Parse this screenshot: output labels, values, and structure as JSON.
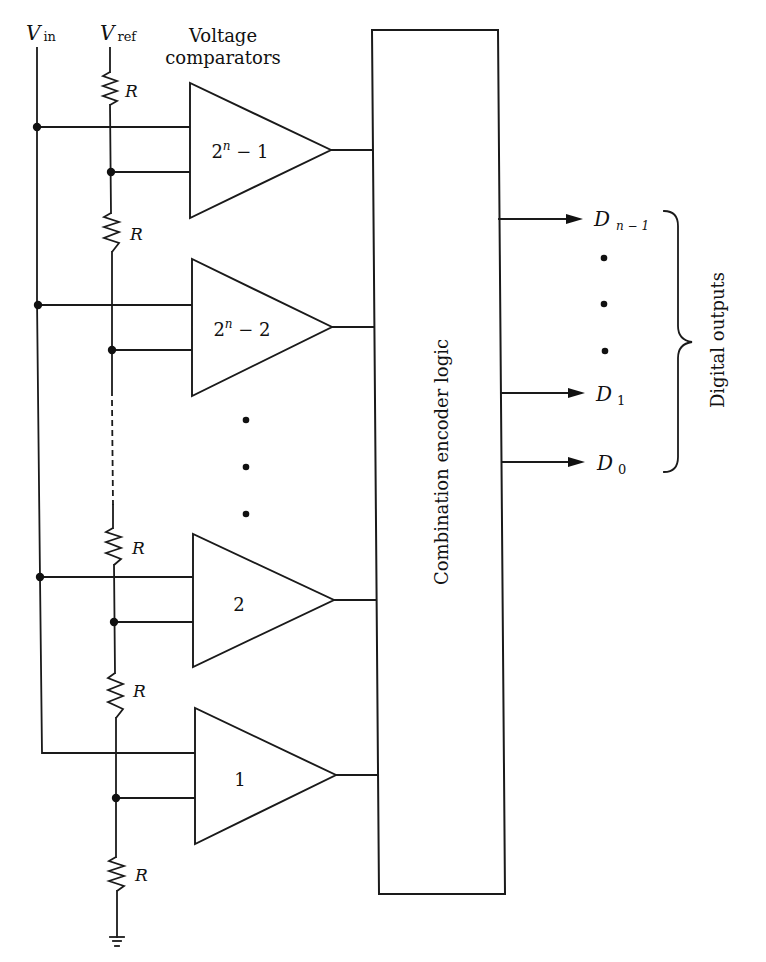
{
  "diagram": {
    "labels": {
      "vin_main": "V",
      "vin_sub": "in",
      "vref_main": "V",
      "vref_sub": "ref",
      "comparators_line1": "Voltage",
      "comparators_line2": "comparators",
      "encoder": "Combination encoder logic",
      "outputs_group": "Digital outputs",
      "resistor": "R"
    },
    "comparators": [
      {
        "id": "c-top",
        "base": "2",
        "exp": "n",
        "suffix": " − 1",
        "label": "2^n − 1"
      },
      {
        "id": "c-second",
        "base": "2",
        "exp": "n",
        "suffix": " − 2",
        "label": "2^n − 2"
      },
      {
        "id": "c-two",
        "label": "2"
      },
      {
        "id": "c-one",
        "label": "1"
      }
    ],
    "resistors": [
      "R",
      "R",
      "R",
      "R",
      "R"
    ],
    "outputs": [
      {
        "main": "D",
        "sub": "n − 1"
      },
      {
        "main": "D",
        "sub": "1"
      },
      {
        "main": "D",
        "sub": "0"
      }
    ],
    "ellipsis": {
      "comparators": "⋮",
      "outputs": "⋮"
    },
    "colors": {
      "line": "#1a1a1a",
      "background": "#ffffff"
    }
  }
}
